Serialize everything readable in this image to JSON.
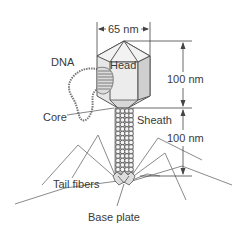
{
  "figure": {
    "labels": {
      "dna": "DNA",
      "head": "Head",
      "core": "Core",
      "sheath": "Sheath",
      "tail_fibers": "Tail fibers",
      "base_plate": "Base plate"
    },
    "dimensions": {
      "head_width": "65 nm",
      "head_height": "100 nm",
      "tail_length": "100 nm"
    },
    "colors": {
      "outline": "#555555",
      "head_fill": "#e6e6e6",
      "head_face_light": "#f2f2f2",
      "head_face_dark": "#cfcfcf",
      "text": "#3a3a3a",
      "fiber": "#8a8a8a"
    }
  }
}
